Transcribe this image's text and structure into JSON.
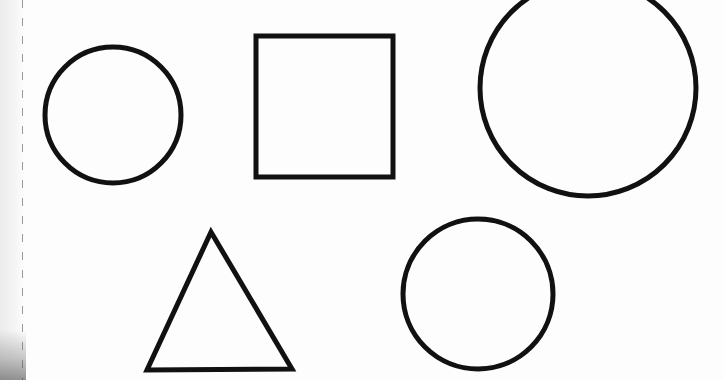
{
  "canvas": {
    "width": 724,
    "height": 380,
    "background": "#fdfdfd"
  },
  "stroke": {
    "color": "#111111",
    "width": 5
  },
  "shapes": [
    {
      "type": "circle",
      "name": "small-circle-top-left",
      "cx": 113,
      "cy": 115,
      "r": 68
    },
    {
      "type": "square",
      "name": "square",
      "x": 256,
      "y": 36,
      "width": 137,
      "height": 141
    },
    {
      "type": "circle",
      "name": "large-circle-top-right",
      "cx": 588,
      "cy": 88,
      "r": 108
    },
    {
      "type": "triangle",
      "name": "triangle",
      "points": [
        [
          211,
          232
        ],
        [
          147,
          370
        ],
        [
          292,
          369
        ]
      ]
    },
    {
      "type": "circle",
      "name": "circle-bottom",
      "cx": 478,
      "cy": 294,
      "r": 75
    }
  ]
}
